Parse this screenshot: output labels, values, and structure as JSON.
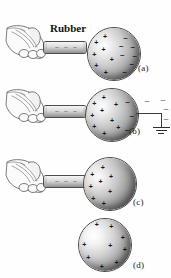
{
  "figure": {
    "rod_label": "Rubber",
    "charge_symbols": {
      "positive": "+",
      "negative": "–"
    },
    "panels": [
      {
        "id": "a",
        "label": "(a)",
        "has_hand": true,
        "has_rod": true,
        "has_ground": false,
        "sphere_charges": {
          "positive": 7,
          "negative": 7,
          "description": "charges separated: positive near rod, negative on far side"
        }
      },
      {
        "id": "b",
        "label": "(b)",
        "has_hand": true,
        "has_rod": true,
        "has_ground": true,
        "escaping_charges": 4,
        "sphere_charges": {
          "positive": 9,
          "negative": 3,
          "description": "grounded sphere, electrons flow to ground"
        }
      },
      {
        "id": "c",
        "label": "(c)",
        "has_hand": true,
        "has_rod": true,
        "has_ground": false,
        "sphere_charges": {
          "positive": 8,
          "negative": 0,
          "description": "ground removed, net positive charge held near rod"
        }
      },
      {
        "id": "d",
        "label": "(d)",
        "has_hand": false,
        "has_rod": false,
        "has_ground": false,
        "sphere_charges": {
          "positive": 9,
          "negative": 0,
          "description": "rod removed, positive charge spreads uniformly"
        }
      }
    ]
  },
  "colors": {
    "background": "#ffffff",
    "ink": "#1a1a1a",
    "sphere_outline": "#4a4a4a",
    "rod_outline": "#4d4d4d",
    "ground": "#2e2e2e"
  }
}
